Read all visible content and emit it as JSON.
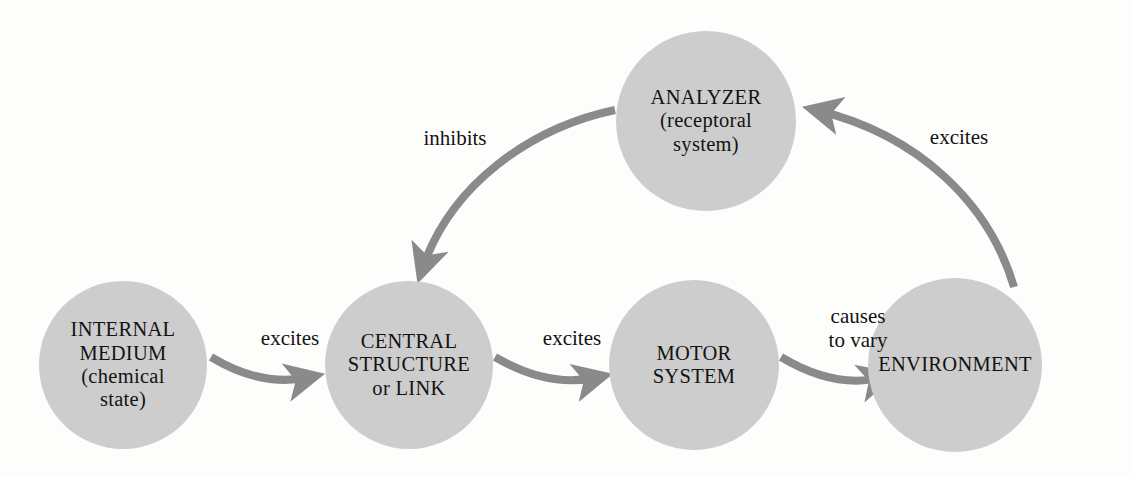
{
  "diagram": {
    "background_color": "#fdfdfc",
    "node_fill_color": "#cdcdcd",
    "arrow_color": "#8a8a8a",
    "text_color": "#131313"
  },
  "nodes": [
    {
      "id": "internal-medium",
      "label": "INTERNAL\nMEDIUM\n(chemical\nstate)",
      "cx": 123,
      "cy": 365,
      "r": 84
    },
    {
      "id": "central-structure",
      "label": "CENTRAL\nSTRUCTURE\nor LINK",
      "cx": 409,
      "cy": 365,
      "r": 84
    },
    {
      "id": "motor-system",
      "label": "MOTOR\nSYSTEM",
      "cx": 694,
      "cy": 365,
      "r": 85
    },
    {
      "id": "environment",
      "label": "ENVIRONMENT",
      "cx": 955,
      "cy": 365,
      "r": 87
    },
    {
      "id": "analyzer",
      "label": "ANALYZER\n(receptoral\nsystem)",
      "cx": 706,
      "cy": 121,
      "r": 90
    }
  ],
  "edges": [
    {
      "id": "internal-to-central",
      "label": "excites",
      "from": "internal-medium",
      "to": "central-structure",
      "label_x": 290,
      "label_y": 333
    },
    {
      "id": "central-to-motor",
      "label": "excites",
      "from": "central-structure",
      "to": "motor-system",
      "label_x": 572,
      "label_y": 333
    },
    {
      "id": "motor-to-environment",
      "label": "causes\nto vary",
      "from": "motor-system",
      "to": "environment",
      "label_x": 858,
      "label_y": 312
    },
    {
      "id": "environment-to-analyzer",
      "label": "excites",
      "from": "environment",
      "to": "analyzer",
      "label_x": 959,
      "label_y": 132
    },
    {
      "id": "analyzer-to-central",
      "label": "inhibits",
      "from": "analyzer",
      "to": "central-structure",
      "label_x": 455,
      "label_y": 133
    }
  ]
}
